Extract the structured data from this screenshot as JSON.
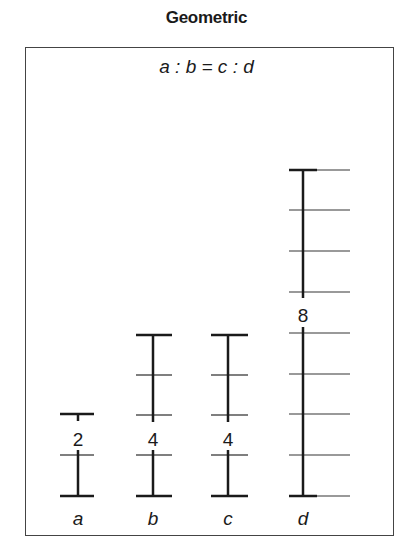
{
  "title": "Geometric",
  "equation": "a : b = c : d",
  "columns": [
    {
      "name": "a",
      "value": "2",
      "units": 2
    },
    {
      "name": "b",
      "value": "4",
      "units": 4
    },
    {
      "name": "c",
      "value": "4",
      "units": 4
    },
    {
      "name": "d",
      "value": "8",
      "units": 8
    }
  ],
  "colors": {
    "ink": "#1a1a1a",
    "frame": "#444444",
    "tick_light": "#777777"
  }
}
